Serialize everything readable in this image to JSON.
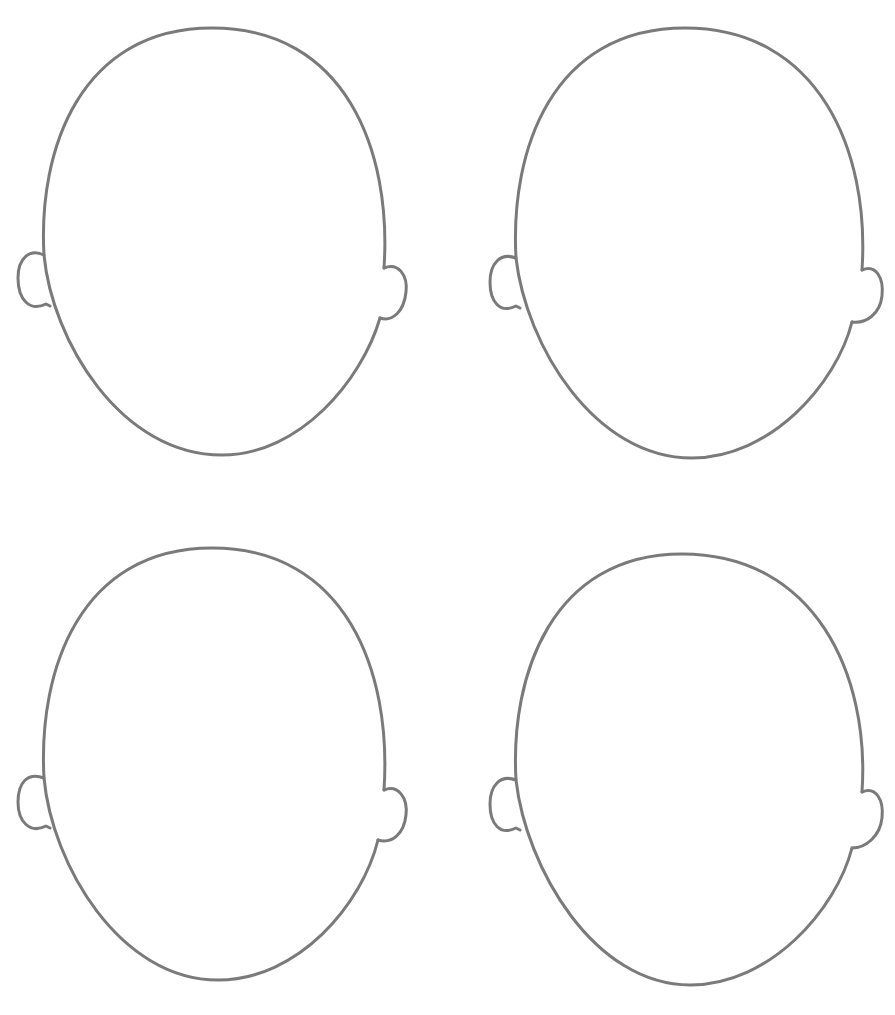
{
  "worksheet": {
    "description": "Four blank face outlines (head with ears) in a 2x2 grid",
    "stroke_color": "#7a7a7a",
    "background_color": "#ffffff",
    "stroke_width": 3,
    "faces": [
      {
        "id": "top-left",
        "cx": 215,
        "top": 28,
        "chin": 455,
        "left": 44,
        "right": 386
      },
      {
        "id": "top-right",
        "cx": 687,
        "top": 28,
        "chin": 458,
        "left": 516,
        "right": 864
      },
      {
        "id": "bottom-left",
        "cx": 215,
        "top": 548,
        "chin": 980,
        "left": 44,
        "right": 386
      },
      {
        "id": "bottom-right",
        "cx": 685,
        "top": 554,
        "chin": 985,
        "left": 516,
        "right": 864
      }
    ]
  }
}
